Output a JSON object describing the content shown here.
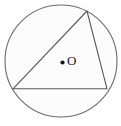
{
  "figure": {
    "type": "geometry-diagram",
    "width": 121,
    "height": 126,
    "background_color": "#ffffff",
    "stroke_color": "#6b6b6b",
    "triangle_stroke_color": "#595959",
    "circle_fill_color": "#fcfcfc",
    "label_color": "#1a1a1a",
    "center_dot_color": "#141414"
  },
  "circle": {
    "name": "circumscribed-circle",
    "center_x": 61,
    "center_y": 61,
    "radius": 56
  },
  "center_point": {
    "label": "O",
    "dot_x": 62.5,
    "dot_y": 62.5,
    "dot_radius": 2.1
  },
  "triangle": {
    "name": "inscribed-triangle",
    "vertices": [
      {
        "name": "bottom-left-vertex",
        "x": 13,
        "y": 88.8
      },
      {
        "name": "bottom-right-vertex",
        "x": 107,
        "y": 88.8
      },
      {
        "name": "top-vertex",
        "x": 87,
        "y": 11
      }
    ],
    "points_attr": "13,88.8 107,88.8 87,11",
    "sides": [
      {
        "name": "base-chord",
        "from": "bottom-left-vertex",
        "to": "bottom-right-vertex"
      },
      {
        "name": "right-chord",
        "from": "bottom-right-vertex",
        "to": "top-vertex"
      },
      {
        "name": "left-chord",
        "from": "top-vertex",
        "to": "bottom-left-vertex"
      }
    ]
  }
}
